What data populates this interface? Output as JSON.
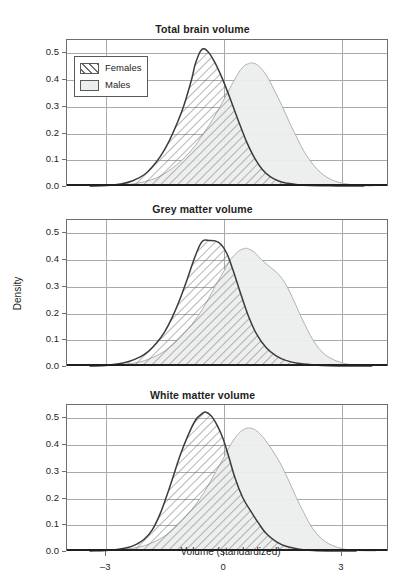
{
  "figure": {
    "axis_title_x": "Volume (standardized)",
    "axis_title_y": "Density",
    "legend": {
      "items": [
        {
          "label": "Females",
          "pattern": "diagonal-hatch",
          "line_color": "#3b3b3b",
          "fill": "#ffffff"
        },
        {
          "label": "Males",
          "pattern": "solid-fill",
          "line_color": "#a7a9ac",
          "fill": "#eceeee"
        }
      ]
    }
  },
  "chart_data": [
    {
      "type": "area",
      "title": "Total brain volume",
      "xlabel": "Volume (standardized)",
      "ylabel": "Density",
      "xlim": [
        -4.0,
        4.2
      ],
      "ylim": [
        0.0,
        0.55
      ],
      "xticks": [
        -3,
        0,
        3
      ],
      "xtick_labels": [
        "–3",
        "0",
        "3"
      ],
      "yticks": [
        0.0,
        0.1,
        0.2,
        0.3,
        0.4,
        0.5
      ],
      "ytick_labels": [
        "0.0",
        "0.1",
        "0.2",
        "0.3",
        "0.4",
        "0.5"
      ],
      "grid": true,
      "legend_position": "upper left",
      "series": [
        {
          "name": "Females",
          "peak_x": -0.55,
          "peak_y": 0.51,
          "x": [
            -3.4,
            -3.0,
            -2.6,
            -2.3,
            -2.0,
            -1.8,
            -1.6,
            -1.4,
            -1.2,
            -1.0,
            -0.8,
            -0.7,
            -0.55,
            -0.4,
            -0.2,
            0.0,
            0.2,
            0.4,
            0.6,
            0.8,
            1.0,
            1.2,
            1.4,
            1.6,
            1.9,
            2.2,
            2.6,
            3.0,
            3.6
          ],
          "values": [
            0.0,
            0.002,
            0.008,
            0.02,
            0.043,
            0.072,
            0.11,
            0.16,
            0.225,
            0.3,
            0.4,
            0.46,
            0.51,
            0.505,
            0.46,
            0.395,
            0.32,
            0.24,
            0.165,
            0.105,
            0.062,
            0.035,
            0.02,
            0.011,
            0.005,
            0.002,
            0.001,
            0.0,
            0.0
          ]
        },
        {
          "name": "Males",
          "peak_x": 0.75,
          "peak_y": 0.46,
          "x": [
            -3.4,
            -3.0,
            -2.6,
            -2.3,
            -2.0,
            -1.7,
            -1.4,
            -1.1,
            -0.8,
            -0.5,
            -0.2,
            0.1,
            0.3,
            0.5,
            0.65,
            0.75,
            0.9,
            1.1,
            1.3,
            1.5,
            1.7,
            1.9,
            2.1,
            2.4,
            2.7,
            3.0,
            3.4,
            3.8
          ],
          "values": [
            0.0,
            0.001,
            0.003,
            0.008,
            0.016,
            0.03,
            0.055,
            0.09,
            0.135,
            0.195,
            0.265,
            0.345,
            0.4,
            0.445,
            0.458,
            0.46,
            0.45,
            0.415,
            0.36,
            0.3,
            0.235,
            0.175,
            0.12,
            0.062,
            0.028,
            0.012,
            0.003,
            0.0
          ]
        }
      ]
    },
    {
      "type": "area",
      "title": "Grey matter volume",
      "xlabel": "Volume (standardized)",
      "ylabel": "Density",
      "xlim": [
        -4.0,
        4.2
      ],
      "ylim": [
        0.0,
        0.55
      ],
      "xticks": [
        -3,
        0,
        3
      ],
      "xtick_labels": [
        "–3",
        "0",
        "3"
      ],
      "yticks": [
        0.0,
        0.1,
        0.2,
        0.3,
        0.4,
        0.5
      ],
      "ytick_labels": [
        "0.0",
        "0.1",
        "0.2",
        "0.3",
        "0.4",
        "0.5"
      ],
      "grid": true,
      "legend_position": "none",
      "series": [
        {
          "name": "Females",
          "peak_x": -0.5,
          "peak_y": 0.47,
          "x": [
            -3.4,
            -3.0,
            -2.7,
            -2.4,
            -2.1,
            -1.9,
            -1.7,
            -1.5,
            -1.3,
            -1.1,
            -0.9,
            -0.75,
            -0.6,
            -0.5,
            -0.35,
            -0.2,
            -0.05,
            0.1,
            0.25,
            0.45,
            0.65,
            0.85,
            1.1,
            1.35,
            1.6,
            1.9,
            2.3,
            2.7,
            3.2,
            3.8
          ],
          "values": [
            0.0,
            0.002,
            0.007,
            0.017,
            0.035,
            0.055,
            0.085,
            0.125,
            0.18,
            0.25,
            0.33,
            0.395,
            0.45,
            0.47,
            0.47,
            0.468,
            0.455,
            0.42,
            0.36,
            0.27,
            0.185,
            0.12,
            0.068,
            0.038,
            0.021,
            0.01,
            0.004,
            0.001,
            0.0,
            0.0
          ]
        },
        {
          "name": "Males",
          "peak_x": 0.6,
          "peak_y": 0.44,
          "x": [
            -3.4,
            -3.0,
            -2.6,
            -2.3,
            -2.0,
            -1.7,
            -1.4,
            -1.1,
            -0.8,
            -0.5,
            -0.25,
            0.0,
            0.2,
            0.4,
            0.55,
            0.65,
            0.8,
            1.0,
            1.2,
            1.4,
            1.6,
            1.8,
            2.0,
            2.3,
            2.6,
            3.0,
            3.4,
            3.8
          ],
          "values": [
            0.0,
            0.001,
            0.004,
            0.01,
            0.02,
            0.038,
            0.065,
            0.105,
            0.155,
            0.218,
            0.285,
            0.35,
            0.4,
            0.43,
            0.44,
            0.438,
            0.425,
            0.395,
            0.37,
            0.345,
            0.305,
            0.245,
            0.18,
            0.095,
            0.042,
            0.013,
            0.003,
            0.0
          ]
        }
      ]
    },
    {
      "type": "area",
      "title": "White matter volume",
      "xlabel": "Volume (standardized)",
      "ylabel": "Density",
      "xlim": [
        -4.0,
        4.2
      ],
      "ylim": [
        0.0,
        0.55
      ],
      "xticks": [
        -3,
        0,
        3
      ],
      "xtick_labels": [
        "–3",
        "0",
        "3"
      ],
      "yticks": [
        0.0,
        0.1,
        0.2,
        0.3,
        0.4,
        0.5
      ],
      "ytick_labels": [
        "0.0",
        "0.1",
        "0.2",
        "0.3",
        "0.4",
        "0.5"
      ],
      "grid": true,
      "legend_position": "none",
      "series": [
        {
          "name": "Females",
          "peak_x": -0.45,
          "peak_y": 0.52,
          "x": [
            -3.4,
            -3.0,
            -2.7,
            -2.4,
            -2.2,
            -2.0,
            -1.8,
            -1.6,
            -1.45,
            -1.3,
            -1.1,
            -0.9,
            -0.7,
            -0.55,
            -0.45,
            -0.3,
            -0.15,
            0.0,
            0.15,
            0.3,
            0.5,
            0.7,
            0.9,
            1.1,
            1.35,
            1.6,
            1.9,
            2.3,
            2.8,
            3.4
          ],
          "values": [
            0.0,
            0.002,
            0.006,
            0.014,
            0.026,
            0.045,
            0.08,
            0.14,
            0.2,
            0.265,
            0.355,
            0.43,
            0.49,
            0.512,
            0.52,
            0.505,
            0.47,
            0.42,
            0.35,
            0.275,
            0.2,
            0.15,
            0.105,
            0.065,
            0.035,
            0.018,
            0.008,
            0.002,
            0.0,
            0.0
          ]
        },
        {
          "name": "Males",
          "peak_x": 0.65,
          "peak_y": 0.46,
          "x": [
            -3.4,
            -3.0,
            -2.6,
            -2.3,
            -2.0,
            -1.7,
            -1.4,
            -1.1,
            -0.8,
            -0.5,
            -0.25,
            0.0,
            0.2,
            0.4,
            0.55,
            0.68,
            0.85,
            1.05,
            1.25,
            1.45,
            1.65,
            1.85,
            2.05,
            2.3,
            2.6,
            3.0,
            3.4,
            3.9
          ],
          "values": [
            0.0,
            0.001,
            0.004,
            0.01,
            0.02,
            0.038,
            0.065,
            0.105,
            0.155,
            0.215,
            0.28,
            0.345,
            0.4,
            0.44,
            0.456,
            0.46,
            0.45,
            0.42,
            0.378,
            0.33,
            0.27,
            0.205,
            0.145,
            0.08,
            0.035,
            0.01,
            0.002,
            0.0
          ]
        }
      ]
    }
  ]
}
